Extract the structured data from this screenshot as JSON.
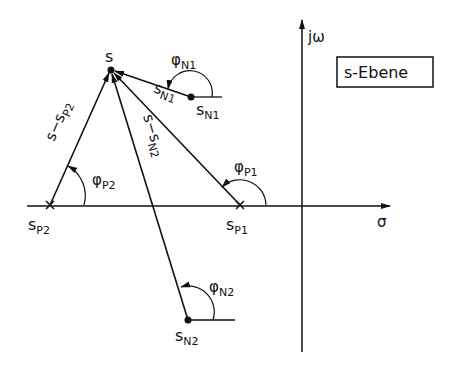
{
  "title_box": "s-Ebene",
  "axes": {
    "imag_label": "jω",
    "real_label": "σ"
  },
  "points": {
    "s": "s",
    "pole1": {
      "base": "s",
      "sub": "P1"
    },
    "pole2": {
      "base": "s",
      "sub": "P2"
    },
    "zero1": {
      "base": "s",
      "sub": "N1"
    },
    "zero2": {
      "base": "s",
      "sub": "N2"
    }
  },
  "vectors": {
    "s_minus_sp2": {
      "base": "s−s",
      "sub": "P2"
    },
    "s_minus_sn2": {
      "base": "s−s",
      "sub": "N2"
    },
    "s_minus_sn1": {
      "base": "s",
      "sub": "N1"
    }
  },
  "angles": {
    "phi_p1": {
      "base": "φ",
      "sub": "P1"
    },
    "phi_p2": {
      "base": "φ",
      "sub": "P2"
    },
    "phi_n1": {
      "base": "φ",
      "sub": "N1"
    },
    "phi_n2": {
      "base": "φ",
      "sub": "N2"
    }
  },
  "colors": {
    "ink": "#111111",
    "background": "#ffffff"
  }
}
